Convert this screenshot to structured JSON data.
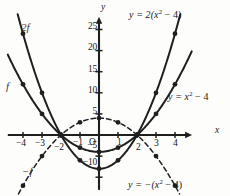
{
  "figure": {
    "axes": {
      "x_axis_label": "x",
      "y_axis_label": "y",
      "origin_label": "O",
      "x_ticks": [
        {
          "value": -4,
          "label": "−4"
        },
        {
          "value": -3,
          "label": "−3"
        },
        {
          "value": -2,
          "label": "−2"
        },
        {
          "value": -1,
          "label": "−1"
        },
        {
          "value": 1,
          "label": "1"
        },
        {
          "value": 2,
          "label": "2"
        },
        {
          "value": 3,
          "label": "3"
        },
        {
          "value": 4,
          "label": "4"
        }
      ],
      "y_ticks": [
        {
          "value": 25,
          "label": "25"
        },
        {
          "value": 20,
          "label": "20"
        },
        {
          "value": 15,
          "label": "15"
        },
        {
          "value": 10,
          "label": "10"
        },
        {
          "value": 5,
          "label": "5"
        },
        {
          "value": -5,
          "label": "−5"
        },
        {
          "value": -10,
          "label": "−10"
        }
      ],
      "xlim": [
        -4.8,
        4.9
      ],
      "ylim": [
        -13,
        28
      ]
    },
    "annotations": {
      "curve_2f": "2f",
      "curve_f": "f",
      "curve_neg_f": "−f",
      "eq_top_prefix": "y = 2(x",
      "eq_top_sup": "2",
      "eq_top_suffix": " − 4)",
      "eq_right_prefix": "y = x",
      "eq_right_sup": "2",
      "eq_right_suffix": " − 4",
      "eq_bottom_prefix": "y = −(x",
      "eq_bottom_sup": "2",
      "eq_bottom_suffix": " − 4)"
    },
    "colors": {
      "ink": "#171717",
      "curve": "#1f1f1f",
      "background": "#fdfdfc",
      "label_gray": "#3a3a3a"
    }
  },
  "chart_data": {
    "type": "line",
    "title": "",
    "xlabel": "x",
    "ylabel": "y",
    "xlim": [
      -4.8,
      4.9
    ],
    "ylim": [
      -13,
      28
    ],
    "grid": false,
    "legend": "inline-annotations",
    "series": [
      {
        "name": "y = x² − 4",
        "annotation": "f",
        "style": "solid",
        "x": [
          -4,
          -3,
          -2,
          -1,
          0,
          1,
          2,
          3,
          4
        ],
        "values": [
          12,
          5,
          0,
          -3,
          -4,
          -3,
          0,
          5,
          12
        ],
        "markers": [
          -4,
          -3,
          -2,
          -1,
          0,
          1,
          2,
          3,
          4
        ]
      },
      {
        "name": "y = 2(x² − 4)",
        "annotation": "2f",
        "style": "solid",
        "x": [
          -4,
          -3,
          -2,
          -1,
          0,
          1,
          2,
          3,
          4
        ],
        "values": [
          24,
          10,
          0,
          -6,
          -8,
          -6,
          0,
          10,
          24
        ],
        "markers": [
          -4,
          -3,
          -2,
          -1,
          0,
          1,
          2,
          3,
          4
        ]
      },
      {
        "name": "y = −(x² − 4)",
        "annotation": "−f",
        "style": "dashed",
        "x": [
          -4,
          -3,
          -2,
          -1,
          0,
          1,
          2,
          3,
          4
        ],
        "values": [
          -12,
          -5,
          0,
          3,
          4,
          3,
          0,
          -5,
          -12
        ],
        "markers": [
          -4,
          -3,
          -2,
          -1,
          0,
          1,
          2,
          3,
          4
        ]
      }
    ]
  }
}
